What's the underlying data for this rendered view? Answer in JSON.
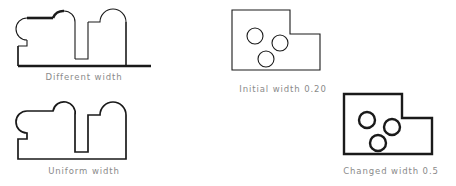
{
  "figures": [
    {
      "id": "different-width",
      "caption": "Different width",
      "shape": "bumpy-base-outline",
      "stroke_style": "variable",
      "stroke_color": "#1a1a1a",
      "description": "Closed outline with three rounded bumps on top and a deep notch, drawn with varying line widths"
    },
    {
      "id": "uniform-width",
      "caption": "Uniform width",
      "shape": "bumpy-base-outline",
      "stroke_style": "uniform",
      "stroke_color": "#1a1a1a",
      "description": "Same outline drawn with a single constant line width"
    },
    {
      "id": "initial-width",
      "caption": "Initial width 0.20",
      "shape": "l-plate-three-holes",
      "stroke_style": "thin",
      "stroke_width_value": "0.20",
      "stroke_color": "#1a1a1a",
      "description": "L-shaped plate with three circular holes drawn with thin lines"
    },
    {
      "id": "changed-width",
      "caption": "Changed width 0.5",
      "shape": "l-plate-three-holes",
      "stroke_style": "thick",
      "stroke_width_value": "0.5",
      "stroke_color": "#1a1a1a",
      "description": "Same L-shaped plate with three holes drawn with thicker lines"
    }
  ],
  "caption_color": "#8a8a8a",
  "background_color": "#ffffff"
}
